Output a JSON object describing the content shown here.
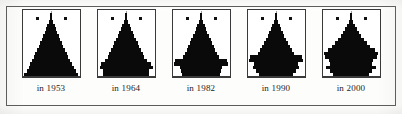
{
  "figure": {
    "background_color": "#fdfdfc",
    "frame_color": "#5d5d5d",
    "bar_color": "#0a0a0a",
    "panel_border_color": "#3a3a3a"
  },
  "panels": [
    {
      "caption": "in 1953"
    },
    {
      "caption": "in 1964"
    },
    {
      "caption": "in 1982"
    },
    {
      "caption": "in 1990"
    },
    {
      "caption": "in 2000"
    }
  ],
  "chart_data": {
    "type": "bar",
    "title": "",
    "subtitle": "",
    "xlabel": "",
    "ylabel": "",
    "orientation": "horizontal",
    "layout": "population-pyramid-small-multiples",
    "grid": false,
    "legend_position": "inside-top",
    "legend": [
      "male",
      "female"
    ],
    "axis_note": "Each panel is an age-sex population pyramid: age increases upward, male share extends left of centre, female share extends right of centre. Values are relative widths (0-1 of half-panel) read off the silhouette.",
    "age_groups_bottom_to_top": [
      "0-4",
      "5-9",
      "10-14",
      "15-19",
      "20-24",
      "25-29",
      "30-34",
      "35-39",
      "40-44",
      "45-49",
      "50-54",
      "55-59",
      "60-64",
      "65-69",
      "70-74",
      "75-79",
      "80-84",
      "85+"
    ],
    "charts": [
      {
        "caption": "in 1953",
        "categories": [
          "0-4",
          "5-9",
          "10-14",
          "15-19",
          "20-24",
          "25-29",
          "30-34",
          "35-39",
          "40-44",
          "45-49",
          "50-54",
          "55-59",
          "60-64",
          "65-69",
          "70-74",
          "75-79",
          "80-84",
          "85+"
        ],
        "series": [
          {
            "name": "male",
            "values": [
              0.95,
              0.86,
              0.79,
              0.73,
              0.67,
              0.61,
              0.55,
              0.49,
              0.43,
              0.37,
              0.31,
              0.26,
              0.21,
              0.16,
              0.12,
              0.08,
              0.05,
              0.02
            ]
          },
          {
            "name": "female",
            "values": [
              0.95,
              0.86,
              0.79,
              0.73,
              0.67,
              0.61,
              0.55,
              0.49,
              0.43,
              0.37,
              0.32,
              0.27,
              0.22,
              0.17,
              0.13,
              0.09,
              0.05,
              0.02
            ]
          }
        ],
        "shape_note": "smooth broad-based triangle, near-linear taper to a narrow apex"
      },
      {
        "caption": "in 1964",
        "categories": [
          "0-4",
          "5-9",
          "10-14",
          "15-19",
          "20-24",
          "25-29",
          "30-34",
          "35-39",
          "40-44",
          "45-49",
          "50-54",
          "55-59",
          "60-64",
          "65-69",
          "70-74",
          "75-79",
          "80-84",
          "85+"
        ],
        "series": [
          {
            "name": "male",
            "values": [
              0.82,
              0.8,
              0.93,
              0.88,
              0.72,
              0.64,
              0.58,
              0.52,
              0.46,
              0.4,
              0.34,
              0.28,
              0.22,
              0.17,
              0.12,
              0.08,
              0.05,
              0.02
            ]
          },
          {
            "name": "female",
            "values": [
              0.82,
              0.8,
              0.93,
              0.88,
              0.72,
              0.64,
              0.58,
              0.52,
              0.46,
              0.41,
              0.35,
              0.29,
              0.24,
              0.18,
              0.13,
              0.09,
              0.05,
              0.02
            ]
          }
        ],
        "shape_note": "triangle with a widened step at the 10-19 cohort, flaring base"
      },
      {
        "caption": "in 1982",
        "categories": [
          "0-4",
          "5-9",
          "10-14",
          "15-19",
          "20-24",
          "25-29",
          "30-34",
          "35-39",
          "40-44",
          "45-49",
          "50-54",
          "55-59",
          "60-64",
          "65-69",
          "70-74",
          "75-79",
          "80-84",
          "85+"
        ],
        "series": [
          {
            "name": "male",
            "values": [
              0.66,
              0.7,
              0.74,
              0.96,
              0.92,
              0.63,
              0.55,
              0.5,
              0.45,
              0.4,
              0.34,
              0.28,
              0.22,
              0.17,
              0.12,
              0.08,
              0.05,
              0.02
            ]
          },
          {
            "name": "female",
            "values": [
              0.66,
              0.7,
              0.74,
              0.96,
              0.92,
              0.63,
              0.56,
              0.5,
              0.45,
              0.4,
              0.35,
              0.29,
              0.23,
              0.18,
              0.13,
              0.08,
              0.05,
              0.02
            ]
          }
        ],
        "shape_note": "pronounced bulge at 15-24, narrower base, notched stepped profile"
      },
      {
        "caption": "in 1990",
        "categories": [
          "0-4",
          "5-9",
          "10-14",
          "15-19",
          "20-24",
          "25-29",
          "30-34",
          "35-39",
          "40-44",
          "45-49",
          "50-54",
          "55-59",
          "60-64",
          "65-69",
          "70-74",
          "75-79",
          "80-84",
          "85+"
        ],
        "series": [
          {
            "name": "male",
            "values": [
              0.6,
              0.7,
              0.8,
              0.78,
              0.94,
              0.9,
              0.62,
              0.54,
              0.48,
              0.42,
              0.36,
              0.29,
              0.23,
              0.17,
              0.12,
              0.08,
              0.05,
              0.02
            ]
          },
          {
            "name": "female",
            "values": [
              0.6,
              0.7,
              0.8,
              0.78,
              0.94,
              0.9,
              0.63,
              0.55,
              0.48,
              0.43,
              0.37,
              0.3,
              0.24,
              0.18,
              0.13,
              0.09,
              0.05,
              0.02
            ]
          }
        ],
        "shape_note": "bulge shifted upward to 20-29, stepped shoulders on both flanks"
      },
      {
        "caption": "in 2000",
        "categories": [
          "0-4",
          "5-9",
          "10-14",
          "15-19",
          "20-24",
          "25-29",
          "30-34",
          "35-39",
          "40-44",
          "45-49",
          "50-54",
          "55-59",
          "60-64",
          "65-69",
          "70-74",
          "75-79",
          "80-84",
          "85+"
        ],
        "series": [
          {
            "name": "male",
            "values": [
              0.62,
              0.74,
              0.88,
              0.72,
              0.78,
              0.92,
              0.96,
              0.82,
              0.66,
              0.56,
              0.46,
              0.36,
              0.27,
              0.19,
              0.13,
              0.08,
              0.05,
              0.02
            ]
          },
          {
            "name": "female",
            "values": [
              0.62,
              0.74,
              0.88,
              0.72,
              0.79,
              0.92,
              0.96,
              0.83,
              0.67,
              0.57,
              0.47,
              0.37,
              0.28,
              0.2,
              0.14,
              0.09,
              0.05,
              0.02
            ]
          }
        ],
        "shape_note": "heavily lobed christmas-tree profile, widest mid-section at 25-39, multiple lateral steps"
      }
    ]
  }
}
